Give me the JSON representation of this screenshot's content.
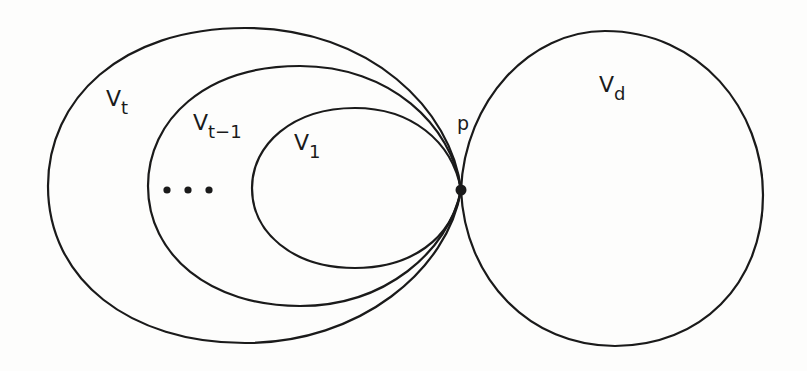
{
  "diagram": {
    "stroke_color": "#1a1a1a",
    "background_color": "#fdfdfc",
    "regions": [
      {
        "id": "Vt",
        "main": "V",
        "sub": "t"
      },
      {
        "id": "Vt-1",
        "main": "V",
        "sub": "t−1"
      },
      {
        "id": "V1",
        "main": "V",
        "sub": "1"
      },
      {
        "id": "Vd",
        "main": "V",
        "sub": "d"
      }
    ],
    "ellipsis": "…",
    "point": {
      "label": "p"
    }
  }
}
